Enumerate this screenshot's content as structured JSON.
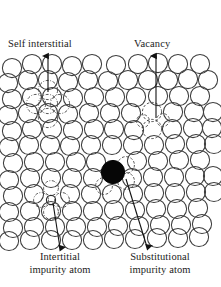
{
  "figure": {
    "background_color": "#ffffff",
    "ink_color": "#1c1c1c",
    "atom_outline_color": "#3a3a3a",
    "impurity_fill_color": "#000000"
  },
  "labels": {
    "self_interstitial": "Self interstitial",
    "vacancy": "Vacancy",
    "interstitial_impurity_line1": "Intertitial",
    "interstitial_impurity_line2": "impurity atom",
    "substitutional_impurity_line1": "Substitutional",
    "substitutional_impurity_line2": "impurity atom"
  },
  "lattice": {
    "atom_radius": 9.6,
    "row_spacing": 16.2,
    "col_spacing": 19.6,
    "rows": 12,
    "description": "Hexagonal close packed array of open circles representing host atoms"
  },
  "defects": [
    {
      "name": "self-interstitial",
      "type": "self interstitial",
      "marker": "dash-dot displaced circles cluster",
      "x": 48,
      "y": 95,
      "arrow_from": {
        "x": 48,
        "y": 92
      },
      "arrow_to": {
        "x": 48,
        "y": 55
      }
    },
    {
      "name": "vacancy",
      "type": "vacancy",
      "marker": "missing atom gap with dashed outlines",
      "x": 152,
      "y": 122,
      "arrow_from": {
        "x": 156,
        "y": 118
      },
      "arrow_to": {
        "x": 156,
        "y": 55
      }
    },
    {
      "name": "interstitial-impurity-atom",
      "type": "interstitial impurity",
      "marker": "small solid circle in interstice",
      "x": 51,
      "y": 200,
      "arrow_from": {
        "x": 53,
        "y": 203
      },
      "arrow_to": {
        "x": 60,
        "y": 249
      }
    },
    {
      "name": "substitutional-impurity-atom",
      "type": "substitutional impurity",
      "marker": "large black filled circle on lattice site",
      "x": 113,
      "y": 172,
      "radius": 11.5,
      "arrow_from": {
        "x": 126,
        "y": 179
      },
      "arrow_to": {
        "x": 147,
        "y": 248
      }
    }
  ]
}
